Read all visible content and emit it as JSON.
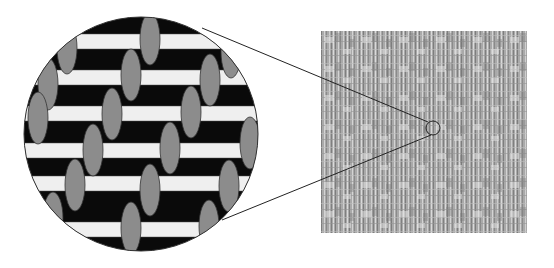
{
  "diagram": {
    "colors": {
      "background": "#ffffff",
      "weave_background": "#0a0a0a",
      "weft_bars": "#f0f0f0",
      "warp_ovals": "#8c8c8c",
      "outline": "#333333",
      "swatch_base": "#a8a8a8",
      "swatch_light": "#d6d6d6",
      "swatch_dark": "#7a7a7a"
    },
    "magnified_circle": {
      "cx": 141,
      "cy": 134,
      "r": 117
    },
    "swatch": {
      "x": 321,
      "y": 31,
      "width": 206,
      "height": 202
    },
    "callout_circle": {
      "cx": 433,
      "cy": 128,
      "r": 7
    },
    "callout_lines": [
      {
        "x1": 202,
        "y1": 28,
        "x2": 429,
        "y2": 122
      },
      {
        "x1": 222,
        "y1": 220,
        "x2": 431,
        "y2": 135
      }
    ]
  }
}
